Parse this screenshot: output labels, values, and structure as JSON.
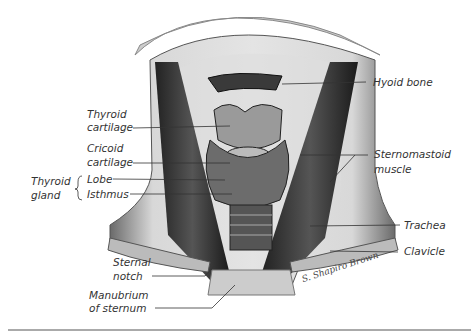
{
  "figure": {
    "labels": {
      "hyoid_bone": "Hyoid bone",
      "thyroid_cartilage_1": "Thyroid",
      "thyroid_cartilage_2": "cartilage",
      "cricoid_cartilage_1": "Cricoid",
      "cricoid_cartilage_2": "cartilage",
      "thyroid_gland_1": "Thyroid",
      "thyroid_gland_2": "gland",
      "lobe": "Lobe",
      "isthmus": "Isthmus",
      "sternomastoid_1": "Sternomastoid",
      "sternomastoid_2": "muscle",
      "trachea": "Trachea",
      "clavicle": "Clavicle",
      "sternal_notch_1": "Sternal",
      "sternal_notch_2": "notch",
      "manubrium_1": "Manubrium",
      "manubrium_2": "of sternum"
    },
    "signature": "S. Shapiro Brown"
  }
}
